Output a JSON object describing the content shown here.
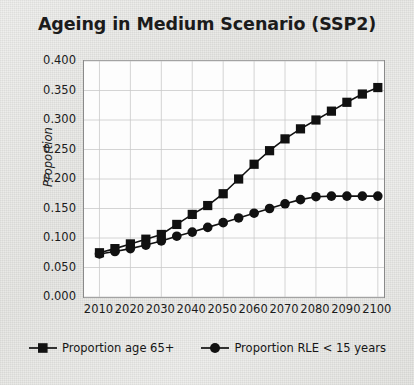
{
  "chart_data": {
    "type": "line",
    "title": "Ageing in Medium Scenario (SSP2)",
    "xlabel": "",
    "ylabel": "Proportion",
    "xlim": [
      2005,
      2102
    ],
    "ylim": [
      0.0,
      0.4
    ],
    "grid": true,
    "legend_position": "bottom",
    "xticks": [
      2010,
      2020,
      2030,
      2040,
      2050,
      2060,
      2070,
      2080,
      2090,
      2100
    ],
    "xtick_labels": [
      "2010",
      "2020",
      "2030",
      "2040",
      "2050",
      "2060",
      "2070",
      "2080",
      "2090",
      "2100"
    ],
    "yticks": [
      0.0,
      0.05,
      0.1,
      0.15,
      0.2,
      0.25,
      0.3,
      0.35,
      0.4
    ],
    "ytick_labels": [
      "0.000",
      "0.050",
      "0.100",
      "0.150",
      "0.200",
      "0.250",
      "0.300",
      "0.350",
      "0.400"
    ],
    "x": [
      2010,
      2015,
      2020,
      2025,
      2030,
      2035,
      2040,
      2045,
      2050,
      2055,
      2060,
      2065,
      2070,
      2075,
      2080,
      2085,
      2090,
      2095,
      2100
    ],
    "series": [
      {
        "name": "Proportion age 65+",
        "marker": "square",
        "color": "#111111",
        "values": [
          0.075,
          0.082,
          0.09,
          0.098,
          0.106,
          0.123,
          0.14,
          0.155,
          0.175,
          0.2,
          0.225,
          0.248,
          0.268,
          0.285,
          0.3,
          0.315,
          0.33,
          0.344,
          0.355
        ]
      },
      {
        "name": "Proportion RLE < 15 years",
        "marker": "circle",
        "color": "#111111",
        "values": [
          0.073,
          0.077,
          0.082,
          0.088,
          0.095,
          0.103,
          0.11,
          0.118,
          0.126,
          0.134,
          0.142,
          0.15,
          0.158,
          0.165,
          0.17,
          0.171,
          0.171,
          0.171,
          0.171
        ]
      }
    ],
    "colors": {
      "series_line": "#111111",
      "grid": "#c9c9c9",
      "axis": "#8a8a8a",
      "plot_background": "#fdfdfd",
      "page_background": "#e9e9e7",
      "text": "#1b1b1b"
    }
  }
}
